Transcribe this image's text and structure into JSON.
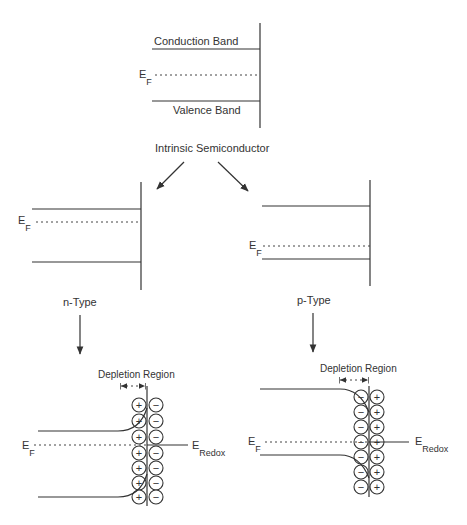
{
  "intrinsic": {
    "conduction_label": "Conduction Band",
    "valence_label": "Valence Band",
    "fermi_main": "E",
    "fermi_sub": "F",
    "caption": "Intrinsic Semiconductor"
  },
  "n_type": {
    "fermi_main": "E",
    "fermi_sub": "F",
    "caption": "n-Type"
  },
  "p_type": {
    "fermi_main": "E",
    "fermi_sub": "F",
    "caption": "p-Type"
  },
  "n_junction": {
    "depletion_label": "Depletion Region",
    "fermi_main": "E",
    "fermi_sub": "F",
    "redox_main": "E",
    "redox_sub": "Redox",
    "left_charges": [
      "+",
      "+",
      "+",
      "+",
      "+",
      "+",
      "+"
    ],
    "right_charges": [
      "−",
      "−",
      "−",
      "−",
      "−",
      "−",
      "−"
    ]
  },
  "p_junction": {
    "depletion_label": "Depletion Region",
    "fermi_main": "E",
    "fermi_sub": "F",
    "redox_main": "E",
    "redox_sub": "Redox",
    "left_charges": [
      "−",
      "−",
      "−",
      "−",
      "−",
      "−",
      "−"
    ],
    "right_charges": [
      "+",
      "+",
      "+",
      "+",
      "+",
      "+",
      "+"
    ]
  }
}
